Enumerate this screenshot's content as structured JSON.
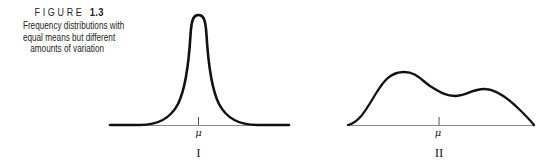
{
  "figure": {
    "label_word": "FIGURE",
    "label_number": "1.3",
    "caption_lines": [
      "Frequency distributions with",
      "equal means but different",
      "amounts of variation"
    ]
  },
  "panels": [
    {
      "id": "I",
      "roman_label": "I",
      "mean_symbol": "μ",
      "shape": "narrow unimodal peak (small variation)"
    },
    {
      "id": "II",
      "roman_label": "II",
      "mean_symbol": "μ",
      "shape": "wide bimodal curve (large variation)"
    }
  ]
}
